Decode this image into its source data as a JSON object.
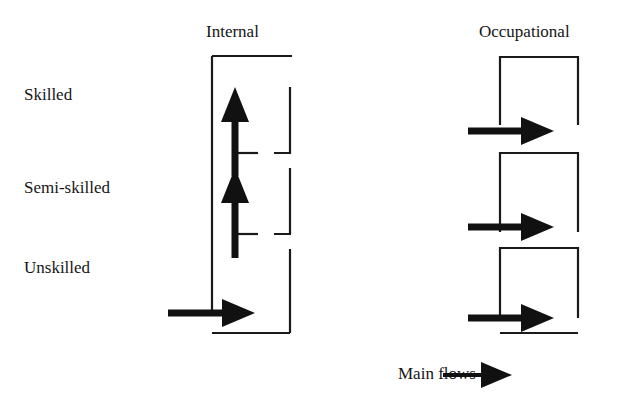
{
  "figure": {
    "type": "flow-diagram",
    "background_color": "#ffffff",
    "line_color": "#1a1a1a",
    "arrow_color": "#111111"
  },
  "columns": [
    {
      "id": "internal",
      "title": "Internal"
    },
    {
      "id": "occupational",
      "title": "Occupational"
    }
  ],
  "row_labels": [
    {
      "id": "skilled",
      "text": "Skilled"
    },
    {
      "id": "semi-skilled",
      "text": "Semi-skilled"
    },
    {
      "id": "unskilled",
      "text": "Unskilled"
    }
  ],
  "legend": {
    "label": "Main flows",
    "symbol": "right-arrow"
  },
  "flows": {
    "internal": [
      {
        "id": "internal-entry",
        "direction": "right",
        "from_level": "external",
        "to_level": "unskilled"
      },
      {
        "id": "internal-up-1",
        "direction": "up",
        "from_level": "unskilled",
        "to_level": "semi-skilled"
      },
      {
        "id": "internal-up-2",
        "direction": "up",
        "from_level": "semi-skilled",
        "to_level": "skilled"
      }
    ],
    "occupational": [
      {
        "id": "occupational-entry-skilled",
        "direction": "right",
        "to_level": "skilled"
      },
      {
        "id": "occupational-entry-semi",
        "direction": "right",
        "to_level": "semi-skilled"
      },
      {
        "id": "occupational-entry-unskilled",
        "direction": "right",
        "to_level": "unskilled"
      }
    ]
  }
}
